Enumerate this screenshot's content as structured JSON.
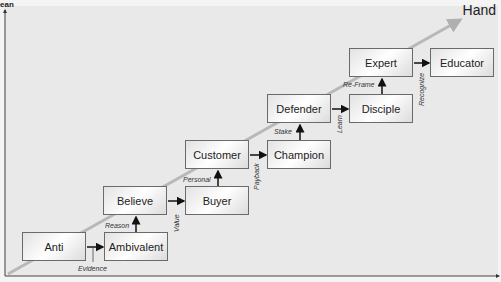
{
  "title": "Hand",
  "corner_text": "ean",
  "boxes": [
    {
      "label": "Anti",
      "x": 22,
      "y": 232
    },
    {
      "label": "Ambivalent",
      "x": 104,
      "y": 232
    },
    {
      "label": "Believe",
      "x": 103,
      "y": 186
    },
    {
      "label": "Buyer",
      "x": 185,
      "y": 186
    },
    {
      "label": "Customer",
      "x": 185,
      "y": 140
    },
    {
      "label": "Champion",
      "x": 267,
      "y": 140
    },
    {
      "label": "Defender",
      "x": 267,
      "y": 94
    },
    {
      "label": "Disciple",
      "x": 349,
      "y": 94
    },
    {
      "label": "Expert",
      "x": 349,
      "y": 48
    },
    {
      "label": "Educator",
      "x": 430,
      "y": 48
    }
  ],
  "transitions": {
    "evidence": "Evidence",
    "reason": "Reason",
    "value": "Value",
    "personal": "Personal",
    "payback": "Payback",
    "stake": "Stake",
    "learn": "Learn",
    "reframe": "Re-Frame",
    "recognize": "Recognize"
  },
  "colors": {
    "background": "#e9e9e9",
    "box_border": "#6a6a6a",
    "trend_arrow": "#b8b8b8",
    "axis": "#444444"
  }
}
